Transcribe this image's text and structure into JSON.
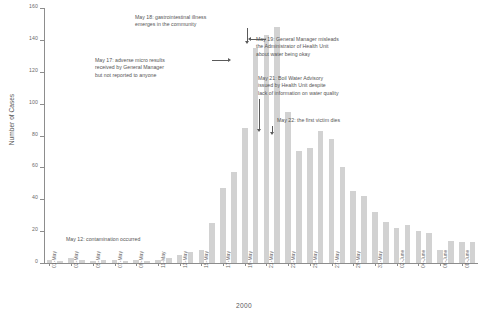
{
  "chart_data": {
    "type": "bar",
    "title": "",
    "subtitle": "",
    "xlabel": "2000",
    "ylabel": "Number of Cases",
    "ylim": [
      0,
      160
    ],
    "ytick_step": 20,
    "yticks": [
      0,
      20,
      40,
      60,
      80,
      100,
      120,
      140,
      160
    ],
    "ytick_labels": [
      "0",
      "20",
      "40",
      "60",
      "80",
      "100",
      "120",
      "140",
      "160"
    ],
    "grid": false,
    "legend": null,
    "bar_color": "#d2d2d2",
    "axis_color": "#8d8d8d",
    "categories": [
      "01-May",
      "02-May",
      "03-May",
      "04-May",
      "05-May",
      "06-May",
      "07-May",
      "08-May",
      "09-May",
      "10-May",
      "11-May",
      "12-May",
      "13-May",
      "14-May",
      "15-May",
      "16-May",
      "17-May",
      "18-May",
      "19-May",
      "20-May",
      "21-May",
      "22-May",
      "23-May",
      "24-May",
      "25-May",
      "26-May",
      "27-May",
      "28-May",
      "29-May",
      "30-May",
      "31-May",
      "01-June",
      "02-June",
      "03-June",
      "04-June",
      "05-June",
      "06-June",
      "07-June",
      "08-June",
      "09-June"
    ],
    "xtick_labels": [
      "01-May",
      "03-May",
      "05-May",
      "07-May",
      "09-May",
      "11-May",
      "13-May",
      "15-May",
      "17-May",
      "19-May",
      "21-May",
      "23-May",
      "25-May",
      "27-May",
      "29-May",
      "31-May",
      "02-June",
      "04-June",
      "06-June",
      "08-June"
    ],
    "values": [
      2,
      1,
      3,
      2,
      1,
      2,
      2,
      1,
      2,
      1,
      2,
      3,
      5,
      7,
      8,
      25,
      47,
      57,
      85,
      135,
      143,
      148,
      95,
      70,
      72,
      83,
      78,
      60,
      45,
      42,
      32,
      26,
      22,
      24,
      20,
      19,
      8,
      14,
      13,
      13
    ],
    "annotations": [
      {
        "id": "may-18",
        "text": "May 18: gastrointestinal illness\nemerges in the community",
        "target_category": "20-May",
        "arrow": "down"
      },
      {
        "id": "may-17",
        "text": "May 17: adverse micro results\nreceived by General Manager\nbut not reported to anyone",
        "target_category": "19-May",
        "arrow": "right"
      },
      {
        "id": "may-19",
        "text": "May 19: General Manager misleads\nthe Administrator of Health Unit\nabout water being okay",
        "target_category": "21-May",
        "arrow": "left"
      },
      {
        "id": "may-21",
        "text": "May 21: Boil Water Advisory\nissued by Health Unit despite\nlack of information on water quality",
        "target_category": "23-May",
        "arrow": "down"
      },
      {
        "id": "may-22",
        "text": "May 22: the first victim dies",
        "target_category": "24-May",
        "arrow": "down"
      },
      {
        "id": "may-12",
        "text": "May 12: contamination occurred",
        "target_category": "",
        "arrow": "none"
      }
    ]
  }
}
